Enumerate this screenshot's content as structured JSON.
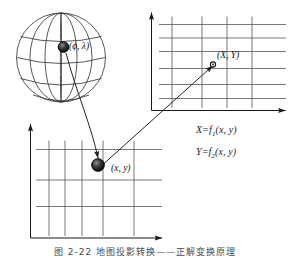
{
  "figure": {
    "caption": "图 2-22  地图投影转换——正解变换原理",
    "sphere_point_label": "(ϕ, λ)",
    "upper_grid_point_label": "(X, Y)",
    "lower_grid_point_label": "(x, y)",
    "formulas": [
      {
        "lhs": "X",
        "eq": "=",
        "fn": "f",
        "sub": "1",
        "args": "(x, y)"
      },
      {
        "lhs": "Y",
        "eq": "=",
        "fn": "f",
        "sub": "2",
        "args": "(x, y)"
      }
    ],
    "colors": {
      "ink": "#1a1a1a",
      "grid": "#555555",
      "sphere": "#3a3a3a",
      "marker_fill": "#111111",
      "background": "#ffffff"
    },
    "elements": {
      "sphere_name": "globe-sphere",
      "upper_grid_name": "projected-plane-grid",
      "lower_grid_name": "source-plane-grid",
      "arrow_sphere_to_plane": "arrow-sphere-to-source-plane",
      "arrow_plane_to_projected": "arrow-source-plane-to-projected-plane"
    }
  }
}
